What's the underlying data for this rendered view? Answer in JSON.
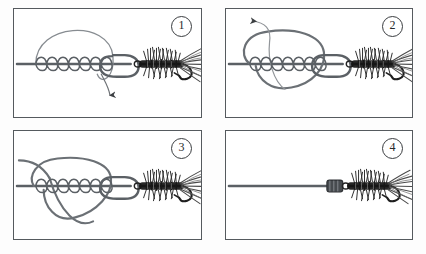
{
  "figure": {
    "type": "instructional-diagram",
    "panel_count": 4,
    "background_color": "#ffffff",
    "border_color": "#555a5e",
    "line_color": "#5b6065",
    "fly_color": "#2b2b2b"
  },
  "panels": [
    {
      "id": "panel-1",
      "step_number": "1",
      "caption": "",
      "elements": {
        "standing_line": "horizontal monofilament line entering from left",
        "wraps": "seven coil wraps around the standing line",
        "loop": "large arc loop above the wraps",
        "tag_loop": "rounded tag loop at hook eye",
        "arrow": "downward arrow below the tag end",
        "fly": "dark hackled wet fly on hook at right"
      }
    },
    {
      "id": "panel-2",
      "step_number": "2",
      "caption": "",
      "elements": {
        "standing_line": "horizontal monofilament line entering from left",
        "wraps": "seven coil wraps around the standing line",
        "loop": "large closed loop encircling the wraps",
        "tag_loop": "rounded tag loop at hook eye",
        "arrow": "arrow pointing up and to the left, pulling the tag end",
        "fly": "dark hackled wet fly on hook at right"
      }
    },
    {
      "id": "panel-3",
      "step_number": "3",
      "caption": "",
      "elements": {
        "standing_line": "horizontal monofilament line entering from left",
        "wraps": "seven coil wraps being drawn tight",
        "loop": "loop cinching down around the wraps",
        "tag_loop": "rounded tag loop at hook eye",
        "fly": "dark hackled wet fly on hook at right"
      }
    },
    {
      "id": "panel-4",
      "step_number": "4",
      "caption": "",
      "elements": {
        "standing_line": "horizontal monofilament line entering from left",
        "knot": "finished seated knot snugged against the hook eye",
        "fly": "dark hackled wet fly on hook at right"
      }
    }
  ]
}
